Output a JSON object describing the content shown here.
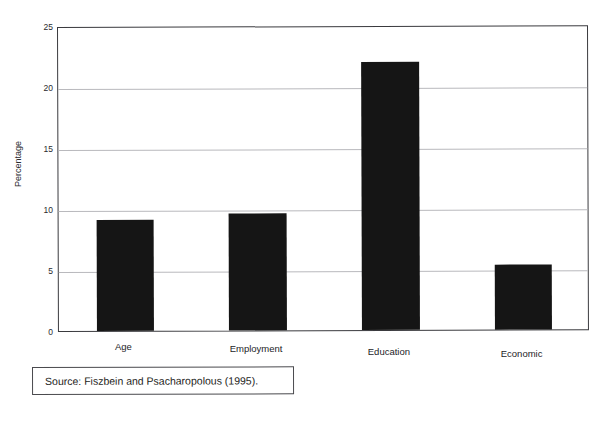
{
  "figure": {
    "title_remnant": "",
    "source_note": "Source: Fiszbein and Psacharopolous (1995)."
  },
  "chart_data": {
    "type": "bar",
    "title": "",
    "xlabel": "",
    "ylabel": "Percentage",
    "categories": [
      "Age",
      "Employment",
      "Education",
      "Economic"
    ],
    "values": [
      9.1,
      9.6,
      22.0,
      5.3
    ],
    "ylim": [
      0,
      25
    ],
    "yticks": [
      0,
      5,
      10,
      15,
      20,
      25
    ],
    "ytick_labels": [
      "0",
      "5",
      "10",
      "15",
      "20",
      "25"
    ],
    "grid": true,
    "legend": null,
    "bar_color": "#151515",
    "grid_color": "#b9b9bd",
    "axis_color": "#3a3a3e",
    "background": "#ffffff"
  }
}
